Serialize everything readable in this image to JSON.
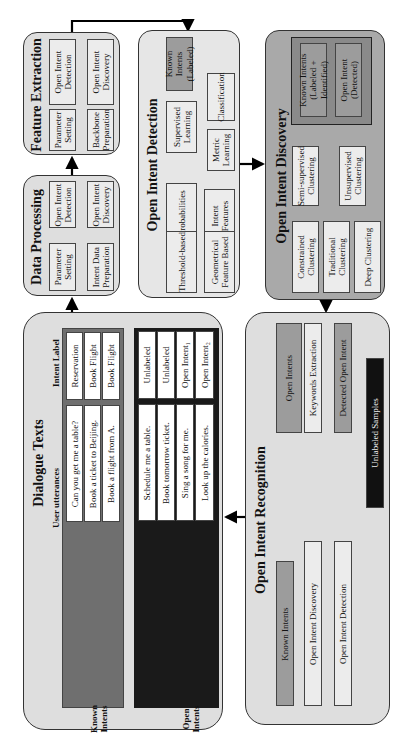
{
  "figure": {
    "panels": {
      "feature_extraction": {
        "title": "Feature Extraction",
        "boxes": [
          "Open Intent Detection",
          "Open Intent Discovery",
          "Parameter Setting",
          "Backbone Preparation"
        ]
      },
      "data_processing": {
        "title": "Data Processing",
        "boxes": [
          "Open Intent Detection",
          "Open Intent Discovery",
          "Parameter Setting",
          "Intent Data Preparation"
        ]
      },
      "dialogue_texts": {
        "title": "Dialogue Texts",
        "col_utterances": "User utterances",
        "col_label": "Intent Label",
        "known_group_label": "Known Intents",
        "open_group_label": "Open Intents",
        "known_rows": [
          {
            "utterance": "Can you get me a table?",
            "label": "Reservation"
          },
          {
            "utterance": "Book a ticket to Beijing.",
            "label": "Book Flight"
          },
          {
            "utterance": "Book a flight from A.",
            "label": "Book Flight"
          }
        ],
        "open_rows": [
          {
            "utterance": "Schedule me a table.",
            "label": "Unlabeled"
          },
          {
            "utterance": "Book tomorrow ticket.",
            "label": "Unlabeled"
          },
          {
            "utterance": "Sing a song for me.",
            "label": "Open Intent₁"
          },
          {
            "utterance": "Look up the calories.",
            "label": "Open Intent₂"
          }
        ]
      },
      "open_intent_detection": {
        "title": "Open Intent Detection",
        "known_intents": "Known Intents (Labeled)",
        "supervised_learning": "Supervised Learning",
        "classification": "Classification",
        "metric_learning": "Metric Learning",
        "probabilities": "Probabilities",
        "intent_features": "Intent Features",
        "threshold_based": "Threshold-based",
        "geometrical": "Geometrical Feature Based"
      },
      "open_intent_discovery": {
        "title": "Open Intent Discovery",
        "known_intents": "Known Intents (Labeled + Identified)",
        "open_intent": "Open Intent (Detected)",
        "semi_supervised": "Semi-supervised Clustering",
        "unsupervised": "Unsupervised Clustering",
        "constrained": "Constrained Clustering",
        "traditional": "Traditional Clustering",
        "deep": "Deep Clustering"
      },
      "open_intent_recognition": {
        "title": "Open Intent Recognition",
        "open_intents": "Open Intents",
        "keywords_extraction": "Keywords Extraction",
        "detected_open_intent": "Detected Open Intent",
        "known_intents": "Known Intents",
        "open_intent_discovery": "Open Intent Discovery",
        "open_intent_detection": "Open Intent Detection",
        "unlabeled_samples": "Unlabeled Samples"
      }
    }
  }
}
